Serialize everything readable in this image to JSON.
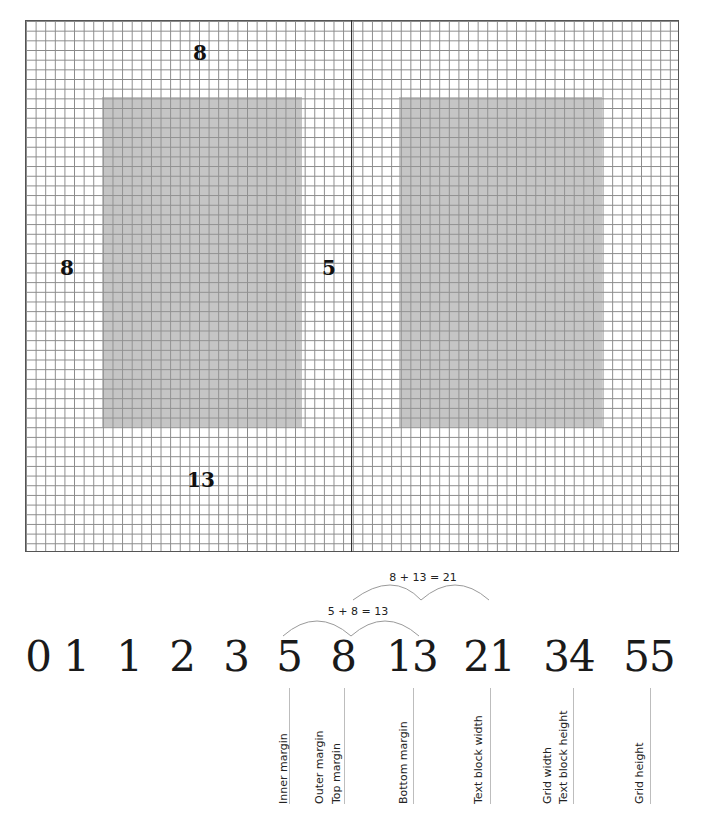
{
  "diagram": {
    "spread": {
      "grid_columns": 68,
      "grid_rows": 55,
      "pages": [
        {
          "name": "left-page",
          "text_block": {
            "x": 102,
            "y": 97,
            "w": 200,
            "h": 330
          }
        },
        {
          "name": "right-page",
          "text_block": {
            "x": 399,
            "y": 97,
            "w": 203,
            "h": 330
          }
        }
      ],
      "margin_labels": {
        "top": "8",
        "outer": "8",
        "inner": "5",
        "bottom": "13"
      }
    },
    "sequence": [
      "0",
      "1",
      "1",
      "2",
      "3",
      "5",
      "8",
      "13",
      "21",
      "34",
      "55"
    ],
    "equations": {
      "first": "5 + 8 = 13",
      "second": "8 + 13 = 21"
    },
    "annotations": [
      {
        "number": "5",
        "labels": [
          "Inner margin"
        ]
      },
      {
        "number": "8",
        "labels": [
          "Outer margin",
          "Top margin"
        ]
      },
      {
        "number": "13",
        "labels": [
          "Bottom margin"
        ]
      },
      {
        "number": "21",
        "labels": [
          "Text block width"
        ]
      },
      {
        "number": "34",
        "labels": [
          "Grid width",
          "Text block height"
        ]
      },
      {
        "number": "55",
        "labels": [
          "Grid height"
        ]
      }
    ],
    "colors": {
      "grid_line": "#8a8a8a",
      "text_block": "#b4b4b4",
      "spine": "#333333",
      "connector": "#bdbdbd"
    }
  }
}
